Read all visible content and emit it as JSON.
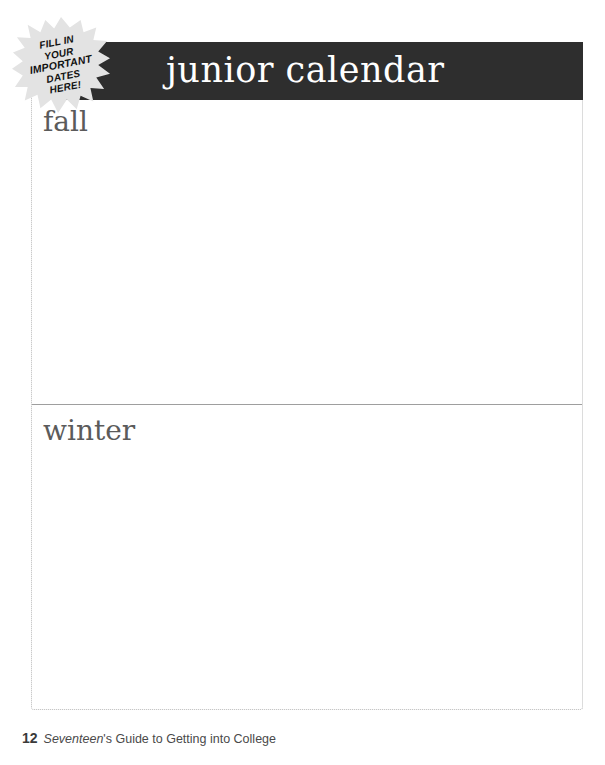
{
  "page": {
    "background_color": "#ffffff",
    "width": 605,
    "height": 765
  },
  "banner": {
    "title": "junior calendar",
    "background_color": "#2e2e2e",
    "text_color": "#ffffff"
  },
  "badge": {
    "name": "fill-in-dates-starburst",
    "shape": "starburst",
    "fill_color": "#e3e3e3",
    "text_color": "#111111",
    "lines": [
      "FILL IN",
      "YOUR",
      "IMPORTANT",
      "DATES",
      "HERE!"
    ]
  },
  "worksheet": {
    "border_color": "#b9b9b9",
    "divider_color": "#9e9e9e",
    "sections": [
      {
        "id": "fall",
        "label": "fall",
        "placeholder": ""
      },
      {
        "id": "winter",
        "label": "winter",
        "placeholder": ""
      }
    ]
  },
  "footer": {
    "page_number": "12",
    "brand": "Seventeen",
    "caption_rest": "'s Guide to Getting into College"
  }
}
